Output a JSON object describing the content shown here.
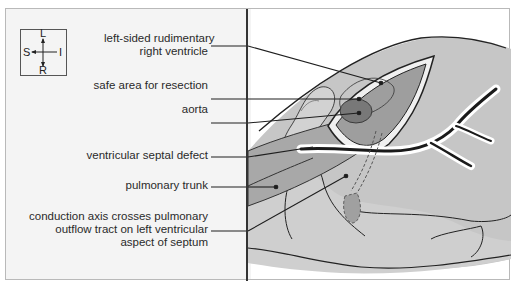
{
  "compass": {
    "top": "L",
    "left": "S",
    "right": "I",
    "bottom": "R"
  },
  "labels": [
    {
      "id": "rudimentary-rv",
      "lines": [
        "left-sided rudimentary",
        "right ventricle"
      ]
    },
    {
      "id": "safe-area",
      "lines": [
        "safe area for resection"
      ]
    },
    {
      "id": "aorta",
      "lines": [
        "aorta"
      ]
    },
    {
      "id": "vsd",
      "lines": [
        "ventricular  septal defect"
      ]
    },
    {
      "id": "pulmonary-trunk",
      "lines": [
        "pulmonary trunk"
      ]
    },
    {
      "id": "conduction-axis",
      "lines": [
        "conduction axis crosses pulmonary",
        "outflow tract on left ventricular",
        "aspect of septum"
      ]
    }
  ],
  "colors": {
    "panel_bg": "#f4f4f4",
    "tissue_light": "#c8c8c8",
    "tissue_mid": "#b4b4b4",
    "tissue_dark": "#8c8c8c",
    "line": "#1e1e1e"
  }
}
